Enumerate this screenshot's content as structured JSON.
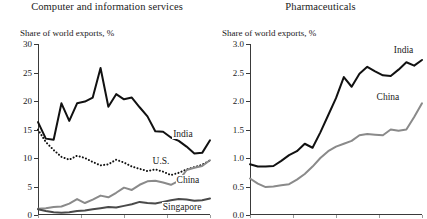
{
  "figure": {
    "width": 427,
    "height": 219,
    "background": "#ffffff"
  },
  "chart_data": [
    {
      "type": "line",
      "panel": "left",
      "title": "Computer and information services",
      "ylabel": "Share of world exports, %",
      "xlabel": "",
      "ylim": [
        0,
        30
      ],
      "yticks": [
        "0",
        "5",
        "10",
        "15",
        "20",
        "25",
        "30"
      ],
      "ytick_values": [
        0,
        5,
        10,
        15,
        20,
        25,
        30
      ],
      "grid": false,
      "legend_position": "inline-right",
      "x": [
        1,
        2,
        3,
        4,
        5,
        6,
        7,
        8,
        9,
        10,
        11,
        12,
        13,
        14,
        15,
        16,
        17,
        18,
        19,
        20,
        21,
        22,
        23
      ],
      "series": [
        {
          "name": "India",
          "color": "#111111",
          "style": "solid",
          "width": 2.0,
          "values": [
            16.3,
            13.4,
            13.2,
            19.6,
            16.5,
            19.6,
            19.9,
            20.6,
            25.8,
            19.0,
            21.2,
            20.3,
            20.6,
            18.9,
            17.3,
            14.7,
            14.6,
            13.6,
            13.0,
            12.0,
            10.8,
            10.9,
            13.1
          ]
        },
        {
          "name": "U.S.",
          "color": "#111111",
          "style": "dotted",
          "width": 2.0,
          "values": [
            15.0,
            12.8,
            11.4,
            10.2,
            9.7,
            10.4,
            10.0,
            9.3,
            8.7,
            8.9,
            9.7,
            9.2,
            8.5,
            8.1,
            7.7,
            8.0,
            7.6,
            7.0,
            7.4,
            8.0,
            8.4,
            8.8,
            9.6
          ]
        },
        {
          "name": "China",
          "color": "#8a8a8a",
          "style": "solid",
          "width": 2.0,
          "values": [
            1.1,
            1.2,
            1.4,
            1.5,
            2.0,
            2.8,
            2.1,
            2.7,
            3.4,
            3.1,
            3.9,
            4.8,
            4.4,
            5.3,
            5.9,
            6.0,
            5.7,
            5.3,
            6.0,
            7.9,
            8.3,
            8.6,
            9.6
          ]
        },
        {
          "name": "Singapore",
          "color": "#4a4a4a",
          "style": "solid",
          "width": 2.0,
          "values": [
            1.0,
            0.7,
            0.5,
            0.4,
            0.5,
            0.7,
            0.8,
            1.0,
            1.2,
            1.4,
            1.3,
            1.6,
            1.9,
            2.3,
            2.1,
            2.0,
            2.3,
            2.6,
            2.8,
            2.7,
            2.5,
            2.6,
            2.9
          ]
        }
      ]
    },
    {
      "type": "line",
      "panel": "right",
      "title": "Pharmaceuticals",
      "ylabel": "Share of world exports, %",
      "xlabel": "",
      "ylim": [
        0.0,
        3.0
      ],
      "yticks": [
        "0.0",
        "0.5",
        "1.0",
        "1.5",
        "2.0",
        "2.5",
        "3.0"
      ],
      "ytick_values": [
        0.0,
        0.5,
        1.0,
        1.5,
        2.0,
        2.5,
        3.0
      ],
      "grid": false,
      "legend_position": "inline-right",
      "x": [
        1,
        2,
        3,
        4,
        5,
        6,
        7,
        8,
        9,
        10,
        11,
        12,
        13,
        14,
        15,
        16,
        17,
        18,
        19,
        20,
        21,
        22,
        23
      ],
      "series": [
        {
          "name": "India",
          "color": "#111111",
          "style": "solid",
          "width": 2.0,
          "values": [
            0.89,
            0.85,
            0.85,
            0.86,
            0.95,
            1.05,
            1.12,
            1.25,
            1.18,
            1.45,
            1.75,
            2.05,
            2.42,
            2.25,
            2.48,
            2.6,
            2.52,
            2.45,
            2.44,
            2.55,
            2.68,
            2.62,
            2.72
          ]
        },
        {
          "name": "China",
          "color": "#8a8a8a",
          "style": "solid",
          "width": 2.0,
          "values": [
            0.64,
            0.55,
            0.49,
            0.5,
            0.52,
            0.54,
            0.62,
            0.72,
            0.85,
            1.0,
            1.12,
            1.2,
            1.25,
            1.3,
            1.4,
            1.42,
            1.41,
            1.4,
            1.5,
            1.48,
            1.5,
            1.72,
            1.96
          ]
        }
      ]
    }
  ]
}
